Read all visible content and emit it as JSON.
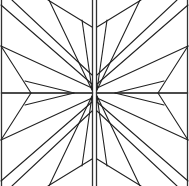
{
  "figure": {
    "stroke_color": "#222222",
    "background_color": "#ffffff",
    "panels": [
      {
        "name": "top-left",
        "x": 0,
        "y": 0,
        "transform": "none"
      },
      {
        "name": "top-right",
        "x": 96,
        "y": 0,
        "transform": "mirror-x"
      },
      {
        "name": "bottom-left",
        "x": 0,
        "y": 107,
        "transform": "mirror-y"
      },
      {
        "name": "bottom-right",
        "x": 96,
        "y": 107,
        "transform": "rotate-180"
      }
    ],
    "panel_size": 92,
    "base_lines": [
      [
        1,
        5,
        92,
        84
      ],
      [
        12,
        0,
        92,
        75
      ],
      [
        49,
        0,
        92,
        90
      ],
      [
        48,
        0,
        92,
        27
      ],
      [
        82,
        20,
        92,
        90
      ],
      [
        1,
        46,
        92,
        88
      ],
      [
        1,
        46,
        31,
        93
      ],
      [
        25,
        81,
        74,
        93
      ]
    ]
  }
}
